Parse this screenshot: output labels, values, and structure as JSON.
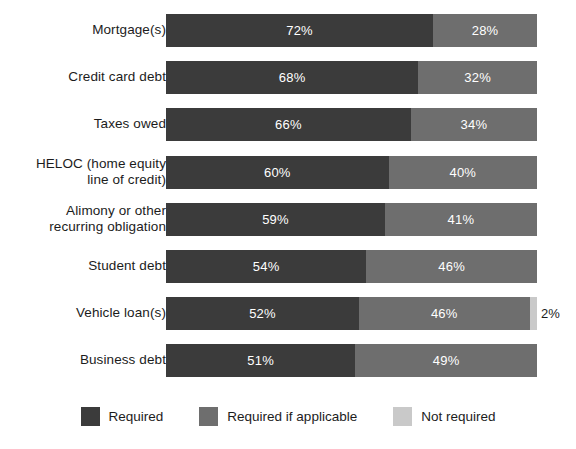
{
  "chart_data": {
    "type": "bar",
    "subtype": "stacked-horizontal-100",
    "title": "",
    "subtitle": "",
    "xlabel": "",
    "ylabel": "",
    "xlim": [
      0,
      100
    ],
    "grid": false,
    "legend_position": "bottom-center",
    "categories": [
      "Mortgage(s)",
      "Credit card debt",
      "Taxes owed",
      "HELOC (home equity\nline of credit)",
      "Alimony or other\nrecurring obligation",
      "Student debt",
      "Vehicle loan(s)",
      "Business debt"
    ],
    "series": [
      {
        "name": "Required",
        "color": "#3b3b3b",
        "values": [
          72,
          68,
          66,
          60,
          59,
          54,
          52,
          51
        ],
        "labels": [
          "72%",
          "68%",
          "66%",
          "60%",
          "59%",
          "54%",
          "52%",
          "51%"
        ]
      },
      {
        "name": "Required if applicable",
        "color": "#6e6e6e",
        "values": [
          28,
          32,
          34,
          40,
          41,
          46,
          46,
          49
        ],
        "labels": [
          "28%",
          "32%",
          "34%",
          "40%",
          "41%",
          "46%",
          "46%",
          "49%"
        ]
      },
      {
        "name": "Not required",
        "color": "#c9c9c9",
        "values": [
          0,
          0,
          0,
          0,
          0,
          0,
          2,
          0
        ],
        "labels": [
          "",
          "",
          "",
          "",
          "",
          "",
          "2%",
          ""
        ]
      }
    ]
  },
  "rows": [
    {
      "label": "Mortgage(s)",
      "lines": 1,
      "segments": [
        {
          "series": "Required",
          "value": 72,
          "label": "72%",
          "inside": true
        },
        {
          "series": "Required if applicable",
          "value": 28,
          "label": "28%",
          "inside": true
        }
      ],
      "outside_label": ""
    },
    {
      "label": "Credit card debt",
      "lines": 1,
      "segments": [
        {
          "series": "Required",
          "value": 68,
          "label": "68%",
          "inside": true
        },
        {
          "series": "Required if applicable",
          "value": 32,
          "label": "32%",
          "inside": true
        }
      ],
      "outside_label": ""
    },
    {
      "label": "Taxes owed",
      "lines": 1,
      "segments": [
        {
          "series": "Required",
          "value": 66,
          "label": "66%",
          "inside": true
        },
        {
          "series": "Required if applicable",
          "value": 34,
          "label": "34%",
          "inside": true
        }
      ],
      "outside_label": ""
    },
    {
      "label": "HELOC (home equity\nline of credit)",
      "lines": 2,
      "segments": [
        {
          "series": "Required",
          "value": 60,
          "label": "60%",
          "inside": true
        },
        {
          "series": "Required if applicable",
          "value": 40,
          "label": "40%",
          "inside": true
        }
      ],
      "outside_label": ""
    },
    {
      "label": "Alimony or other\nrecurring obligation",
      "lines": 2,
      "segments": [
        {
          "series": "Required",
          "value": 59,
          "label": "59%",
          "inside": true
        },
        {
          "series": "Required if applicable",
          "value": 41,
          "label": "41%",
          "inside": true
        }
      ],
      "outside_label": ""
    },
    {
      "label": "Student debt",
      "lines": 1,
      "segments": [
        {
          "series": "Required",
          "value": 54,
          "label": "54%",
          "inside": true
        },
        {
          "series": "Required if applicable",
          "value": 46,
          "label": "46%",
          "inside": true
        }
      ],
      "outside_label": ""
    },
    {
      "label": "Vehicle loan(s)",
      "lines": 1,
      "segments": [
        {
          "series": "Required",
          "value": 52,
          "label": "52%",
          "inside": true
        },
        {
          "series": "Required if applicable",
          "value": 46,
          "label": "46%",
          "inside": true
        },
        {
          "series": "Not required",
          "value": 2,
          "label": "",
          "inside": false
        }
      ],
      "outside_label": "2%"
    },
    {
      "label": "Business debt",
      "lines": 1,
      "segments": [
        {
          "series": "Required",
          "value": 51,
          "label": "51%",
          "inside": true
        },
        {
          "series": "Required if applicable",
          "value": 49,
          "label": "49%",
          "inside": true
        }
      ],
      "outside_label": ""
    }
  ],
  "legend": {
    "items": [
      {
        "label": "Required",
        "color": "#3b3b3b",
        "key": "req"
      },
      {
        "label": "Required if applicable",
        "color": "#6e6e6e",
        "key": "req-if"
      },
      {
        "label": "Not required",
        "color": "#c9c9c9",
        "key": "not-req"
      }
    ]
  },
  "colors": {
    "required": "#3b3b3b",
    "required_if_applicable": "#6e6e6e",
    "not_required": "#c9c9c9",
    "background": "#ffffff",
    "text": "#1c1c1c",
    "value_text_on_dark": "#ffffff"
  }
}
